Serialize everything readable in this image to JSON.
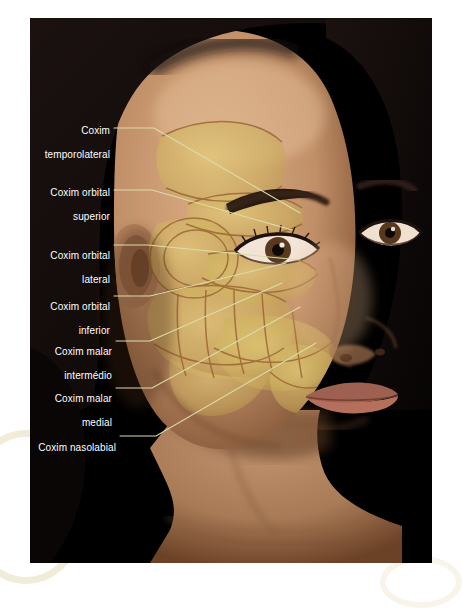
{
  "figure": {
    "language": "pt-BR",
    "background_color": "#ffffff",
    "plate_color": "#000000",
    "label_text_color": "#ffffff",
    "leader_line_color": "#dcdca8",
    "overlay_fill_color": "#d8c06a",
    "overlay_outline_color": "#a8703c"
  },
  "labels": [
    {
      "id": "coxim-temporolateral",
      "line1": "Coxim",
      "line2": "temporolateral",
      "text": "Coxim temporolateral"
    },
    {
      "id": "coxim-orbital-superior",
      "line1": "Coxim orbital",
      "line2": "superior",
      "text": "Coxim orbital superior"
    },
    {
      "id": "coxim-orbital-lateral",
      "line1": "Coxim orbital",
      "line2": "lateral",
      "text": "Coxim orbital lateral"
    },
    {
      "id": "coxim-orbital-inferior",
      "line1": "Coxim orbital",
      "line2": "inferior",
      "text": "Coxim orbital inferior"
    },
    {
      "id": "coxim-malar-intermedio",
      "line1": "Coxim malar",
      "line2": "intermédio",
      "text": "Coxim malar intermédio"
    },
    {
      "id": "coxim-malar-medial",
      "line1": "Coxim malar",
      "line2": "medial",
      "text": "Coxim malar medial"
    },
    {
      "id": "coxim-nasolabial",
      "line1": "Coxim nasolabial",
      "line2": "",
      "text": "Coxim nasolabial"
    }
  ],
  "subject": {
    "description": "Fotografia de rosto feminino em vista três quartos sobre fundo preto",
    "skin_color": "#c79a74",
    "hair_color": "#120b08"
  }
}
